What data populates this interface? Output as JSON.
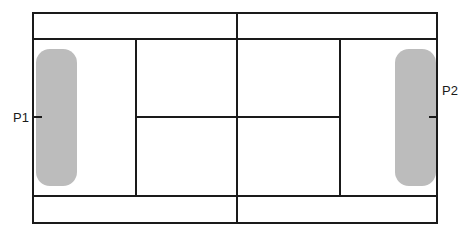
{
  "diagram": {
    "type": "tennis-court-top-view",
    "colors": {
      "lines": "#1a1a1a",
      "zone": "#bcbcbc",
      "background": "#ffffff"
    },
    "players": [
      {
        "label": "P1",
        "side": "left"
      },
      {
        "label": "P2",
        "side": "right"
      }
    ]
  }
}
